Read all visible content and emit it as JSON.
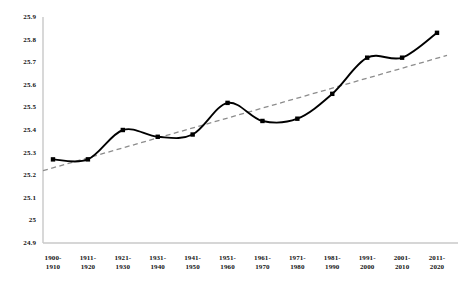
{
  "chart_data": {
    "type": "line",
    "title": "",
    "subtitle": "",
    "xlabel": "",
    "ylabel": "",
    "ylim": [
      24.9,
      25.9
    ],
    "ytick_labels": [
      "25.9",
      "25.8",
      "25.7",
      "25.6",
      "25.5",
      "25.4",
      "25.3",
      "25.2",
      "25.1",
      "25",
      "24.9"
    ],
    "ytick_values": [
      25.9,
      25.8,
      25.7,
      25.6,
      25.5,
      25.4,
      25.3,
      25.2,
      25.1,
      25.0,
      24.9
    ],
    "grid": false,
    "legend": "none",
    "categories": [
      "1900-\n1910",
      "1911-\n1920",
      "1921-\n1930",
      "1931-\n1940",
      "1941-\n1950",
      "1951-\n1960",
      "1961-\n1970",
      "1971-\n1980",
      "1981-\n1990",
      "1991-\n2000",
      "2001-\n2010",
      "2011-\n2020"
    ],
    "series": [
      {
        "name": "value",
        "style": "solid-black-smooth-with-markers",
        "marker": "square",
        "color": "#000000",
        "values": [
          25.27,
          25.27,
          25.4,
          25.37,
          25.38,
          25.52,
          25.44,
          25.45,
          25.56,
          25.72,
          25.72,
          25.83
        ]
      },
      {
        "name": "trendline",
        "style": "dashed-gray-linear",
        "color": "#8c8c8c",
        "start_value": 25.22,
        "end_value": 25.73
      }
    ]
  },
  "axes": {
    "axis_color": "#c8c8c8",
    "text_color": "#121212"
  }
}
